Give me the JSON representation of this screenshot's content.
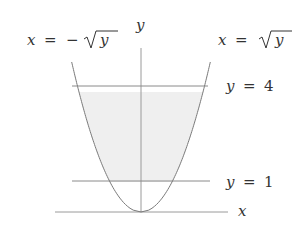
{
  "diagram": {
    "labels": {
      "y_axis": "y",
      "x_axis": "x",
      "left_curve": {
        "lhs": "x",
        "eq": "=",
        "minus": "−",
        "rad": "y"
      },
      "right_curve": {
        "lhs": "x",
        "eq": "=",
        "rad": "y"
      },
      "upper_line": {
        "var": "y",
        "eq": "=",
        "val": "4"
      },
      "lower_line": {
        "var": "y",
        "eq": "=",
        "val": "1"
      }
    },
    "colors": {
      "shading": "#efefef",
      "axis": "#9a9a9a",
      "curve": "#7a7a7a",
      "lines": "#8a8a8a",
      "text": "#333333"
    },
    "geometry": {
      "origin_px": [
        141,
        212
      ],
      "unit_px": 31,
      "y_lines": [
        1,
        4
      ],
      "curve_ymax": 5
    }
  }
}
